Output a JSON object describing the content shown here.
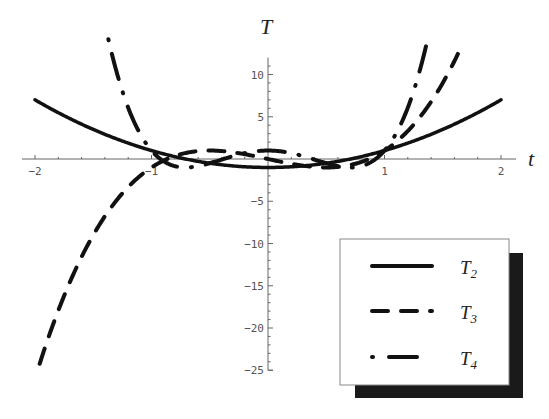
{
  "chart_data": {
    "type": "line",
    "title": "",
    "xlabel": "t",
    "ylabel": "T",
    "xlim": [
      -2,
      2
    ],
    "ylim": [
      -25,
      12
    ],
    "x_ticks": [
      -2,
      -1,
      1,
      2
    ],
    "x_tick_labels": [
      "-2",
      "-1",
      "1",
      "2"
    ],
    "y_ticks": [
      10,
      5,
      -5,
      -10,
      -15,
      -20,
      -25
    ],
    "y_tick_labels": [
      "10",
      "5",
      "-5",
      "-10",
      "-15",
      "-20",
      "-25"
    ],
    "grid": false,
    "legend_position": "lower right (boxed, with drop shadow)",
    "series": [
      {
        "name": "T2",
        "label_main": "T",
        "label_sub": "2",
        "style": "solid",
        "formula": "2t^2 - 1",
        "x": [
          -2,
          -1.5,
          -1,
          -0.5,
          0,
          0.5,
          1,
          1.5,
          2
        ],
        "y": [
          7,
          3.5,
          1,
          -0.5,
          -1,
          -0.5,
          1,
          3.5,
          7
        ]
      },
      {
        "name": "T3",
        "label_main": "T",
        "label_sub": "3",
        "style": "dashed",
        "formula": "4t^3 - 3t",
        "x": [
          -1.96,
          -1.5,
          -1,
          -0.5,
          0,
          0.5,
          1,
          1.5,
          1.63
        ],
        "y": [
          -24.2,
          -9,
          -1,
          1,
          0,
          -1,
          1,
          9,
          12
        ]
      },
      {
        "name": "T4",
        "label_main": "T",
        "label_sub": "4",
        "style": "dash-dot",
        "formula": "8t^4 - 8t^2 + 1",
        "x": [
          -1.37,
          -1.2,
          -1,
          -0.707,
          0,
          0.707,
          1,
          1.2,
          1.37
        ],
        "y": [
          11.8,
          6.1,
          1,
          -1,
          1,
          -1,
          1,
          6.1,
          11.8
        ]
      }
    ]
  },
  "axes": {
    "x_title": "t",
    "y_title": "T"
  },
  "legend": {
    "items": [
      {
        "main": "T",
        "sub": "2",
        "style": "solid"
      },
      {
        "main": "T",
        "sub": "3",
        "style": "dashed"
      },
      {
        "main": "T",
        "sub": "4",
        "style": "dash-dot"
      }
    ]
  },
  "colors": {
    "line": "#111111",
    "axis": "#666666",
    "tick_text": "#555555",
    "shadow": "#1a1a1a",
    "legend_bg": "#ffffff"
  }
}
